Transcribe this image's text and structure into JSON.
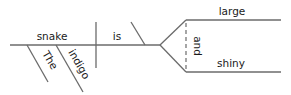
{
  "diagram": {
    "type": "sentence-diagram",
    "colors": {
      "line": "#6b6b6b",
      "text": "#1a1a1a",
      "background": "#ffffff"
    },
    "words": {
      "subject": "snake",
      "verb": "is",
      "predicate_adjective_1": "large",
      "predicate_adjective_2": "shiny",
      "conjunction": "and",
      "modifier_1": "The",
      "modifier_2": "indigo"
    }
  }
}
